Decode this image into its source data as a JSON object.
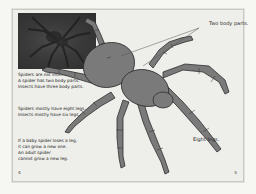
{
  "book_spread": {
    "left_page": {
      "page_number": "4",
      "photo": {
        "subject": "spider-photo"
      },
      "paragraphs": [
        {
          "lines": [
            "Spiders are not insects.",
            "A spider has two body parts.",
            "Insects have three body parts."
          ]
        },
        {
          "lines": [
            "Spiders mostly have eight legs.",
            "Insects mostly have six legs."
          ]
        },
        {
          "lines": [
            "If a baby spider loses a leg,",
            "it can grow a new one.",
            "An adult spider",
            "cannot grow a new leg."
          ]
        }
      ]
    },
    "right_page": {
      "page_number": "5",
      "illustration": {
        "subject": "spider-illustration"
      },
      "labels": {
        "body_parts": "Two body parts.",
        "legs": "Eight legs."
      }
    }
  },
  "colors": {
    "page_bg": "#eeeeea",
    "spider_fill": "#7a7a7a",
    "spider_outline": "#2e2e2e",
    "photo_bg": "#3a3a3a"
  }
}
